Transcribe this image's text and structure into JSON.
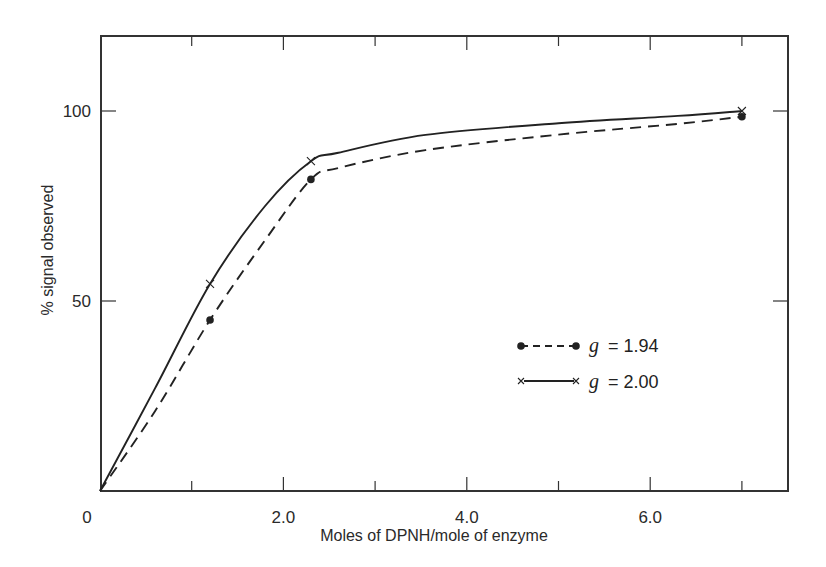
{
  "chart_data": {
    "type": "line",
    "title": "",
    "xlabel": "Moles of DPNH/mole of enzyme",
    "ylabel": "% signal observed",
    "xlim": [
      0,
      7.55
    ],
    "ylim": [
      0,
      120
    ],
    "grid": false,
    "legend_position": "inside-right-middle",
    "x_ticks": [
      {
        "value": 0,
        "label": "0"
      },
      {
        "value": 1.0,
        "label": ""
      },
      {
        "value": 2.0,
        "label": "2.0"
      },
      {
        "value": 3.0,
        "label": ""
      },
      {
        "value": 4.0,
        "label": "4.0"
      },
      {
        "value": 5.0,
        "label": ""
      },
      {
        "value": 6.0,
        "label": "6.0"
      },
      {
        "value": 7.0,
        "label": ""
      }
    ],
    "y_ticks": [
      {
        "value": 50,
        "label": "50"
      },
      {
        "value": 100,
        "label": "100"
      }
    ],
    "series": [
      {
        "name": "g = 1.94",
        "g_label": "g",
        "g_value": "= 1.94",
        "marker": "dot",
        "line_style": "dashed",
        "points": [
          {
            "x": 0,
            "y": 0
          },
          {
            "x": 1.2,
            "y": 45
          },
          {
            "x": 2.3,
            "y": 82
          },
          {
            "x": 7.0,
            "y": 98.5
          }
        ],
        "curve": [
          {
            "x": 0,
            "y": 0
          },
          {
            "x": 0.6,
            "y": 21
          },
          {
            "x": 1.2,
            "y": 45
          },
          {
            "x": 1.8,
            "y": 66
          },
          {
            "x": 2.3,
            "y": 82
          },
          {
            "x": 2.6,
            "y": 85
          },
          {
            "x": 3.55,
            "y": 89.7
          },
          {
            "x": 5.0,
            "y": 93.8
          },
          {
            "x": 6.3,
            "y": 96.6
          },
          {
            "x": 7.0,
            "y": 98.5
          }
        ]
      },
      {
        "name": "g = 2.00",
        "g_label": "g",
        "g_value": "= 2.00",
        "marker": "x",
        "line_style": "solid",
        "points": [
          {
            "x": 0,
            "y": 0
          },
          {
            "x": 1.2,
            "y": 54.5
          },
          {
            "x": 2.3,
            "y": 86.8
          },
          {
            "x": 7.0,
            "y": 100
          }
        ],
        "curve": [
          {
            "x": 0,
            "y": 0
          },
          {
            "x": 0.6,
            "y": 27
          },
          {
            "x": 1.2,
            "y": 54.5
          },
          {
            "x": 1.8,
            "y": 75
          },
          {
            "x": 2.3,
            "y": 86.8
          },
          {
            "x": 2.6,
            "y": 89
          },
          {
            "x": 3.55,
            "y": 93.7
          },
          {
            "x": 5.0,
            "y": 96.8
          },
          {
            "x": 6.3,
            "y": 98.7
          },
          {
            "x": 7.0,
            "y": 100
          }
        ]
      }
    ]
  },
  "style": {
    "ink": "#222222",
    "frame": "#333333",
    "background": "#ffffff"
  }
}
